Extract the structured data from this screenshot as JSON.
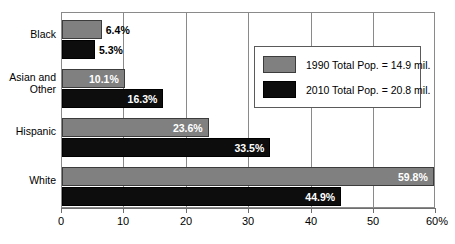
{
  "chart_data": {
    "type": "bar",
    "orientation": "horizontal",
    "title": "",
    "subtitle": "",
    "xlabel": "",
    "ylabel": "",
    "xlim": [
      0,
      60
    ],
    "grid": true,
    "legend_position": "inside-upper-right",
    "categories": [
      "Black",
      "Asian and\nOther",
      "Hispanic",
      "White"
    ],
    "tick_labels": [
      "0",
      "10",
      "20",
      "30",
      "40",
      "50",
      "60%"
    ],
    "tick_values": [
      0,
      10,
      20,
      30,
      40,
      50,
      60
    ],
    "series": [
      {
        "name": "1990 Total Pop. = 14.9 mil.",
        "color": "#808080",
        "values": [
          6.4,
          10.1,
          23.6,
          59.8
        ],
        "labels": [
          "6.4%",
          "10.1%",
          "23.6%",
          "59.8%"
        ],
        "label_placement": [
          "outside",
          "inside",
          "inside",
          "inside"
        ]
      },
      {
        "name": "2010 Total Pop. = 20.8 mil.",
        "color": "#0d0d0d",
        "values": [
          5.3,
          16.3,
          33.5,
          44.9
        ],
        "labels": [
          "5.3%",
          "16.3%",
          "33.5%",
          "44.9%"
        ],
        "label_placement": [
          "outside",
          "inside",
          "inside",
          "inside"
        ]
      }
    ]
  },
  "legend": {
    "items": [
      {
        "label": "1990 Total Pop. = 14.9 mil.",
        "swatch": "gray-swatch"
      },
      {
        "label": "2010 Total Pop. = 20.8 mil.",
        "swatch": "black-swatch"
      }
    ]
  },
  "axis": {
    "x_ticks": [
      "0",
      "10",
      "20",
      "30",
      "40",
      "50",
      "60%"
    ]
  },
  "categories": {
    "items": [
      "Black",
      "Asian and\nOther",
      "Hispanic",
      "White"
    ]
  }
}
